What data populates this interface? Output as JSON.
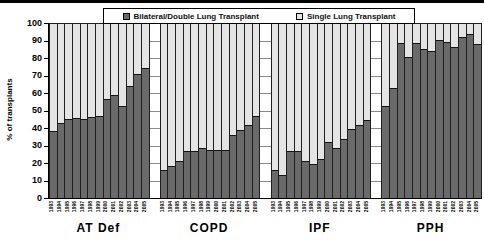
{
  "figure": {
    "top_rule_color": "#000000",
    "background": "#ffffff"
  },
  "chart_data": {
    "type": "bar",
    "stacked": true,
    "ylabel": "% of transplants",
    "ylim": [
      0,
      100
    ],
    "yticks": [
      0,
      10,
      20,
      30,
      40,
      50,
      60,
      70,
      80,
      90,
      100
    ],
    "grid": "horizontal",
    "gridline_color": "#8a8a8a",
    "legend_position": "top",
    "legend": [
      {
        "label": "Bilateral/Double Lung Transplant",
        "color": "#6a6a6a"
      },
      {
        "label": "Single Lung Transplant",
        "color": "#e4e4e4"
      }
    ],
    "years": [
      "1993",
      "1994",
      "1995",
      "1996",
      "1997",
      "1998",
      "1999",
      "2000",
      "2001",
      "2002",
      "2003",
      "2004",
      "2005"
    ],
    "groups": [
      {
        "label": "AT Def",
        "bilateral_pct": [
          38.5,
          43,
          45.5,
          46,
          45.5,
          46.5,
          47,
          57,
          59,
          53,
          64.5,
          71,
          75
        ]
      },
      {
        "label": "COPD",
        "bilateral_pct": [
          16,
          18.5,
          21,
          27,
          27,
          28.5,
          27.5,
          27.5,
          27.5,
          36.5,
          39,
          42,
          47
        ]
      },
      {
        "label": "IPF",
        "bilateral_pct": [
          16,
          13.5,
          27,
          27,
          21.5,
          19.5,
          22.5,
          32,
          28.5,
          34,
          39.5,
          42,
          45
        ]
      },
      {
        "label": "PPH",
        "bilateral_pct": [
          53,
          63,
          89,
          81,
          89,
          85.5,
          84.5,
          91,
          89.5,
          87,
          92.5,
          94.5,
          88.5
        ]
      }
    ],
    "single_pct_rule": "100 minus bilateral_pct"
  }
}
